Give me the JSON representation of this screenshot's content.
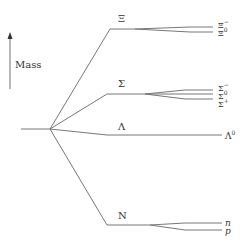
{
  "axis": {
    "label": "Mass",
    "icon": "up-arrow-icon"
  },
  "multiplets": [
    {
      "name": "Xi",
      "symbol": "Ξ",
      "members": [
        {
          "base": "Ξ",
          "sup": "−"
        },
        {
          "base": "Ξ",
          "sup": "0"
        }
      ]
    },
    {
      "name": "Sigma",
      "symbol": "Σ",
      "members": [
        {
          "base": "Σ",
          "sup": "−"
        },
        {
          "base": "Σ",
          "sup": "0"
        },
        {
          "base": "Σ",
          "sup": "+"
        }
      ]
    },
    {
      "name": "Lambda",
      "symbol": "Λ",
      "members": [
        {
          "base": "Λ",
          "sup": "0"
        }
      ]
    },
    {
      "name": "Nucleon",
      "symbol": "N",
      "members": [
        {
          "base": "n",
          "sup": ""
        },
        {
          "base": "p",
          "sup": ""
        }
      ]
    }
  ],
  "colors": {
    "line": "#6e6e6e",
    "text": "#333333"
  }
}
